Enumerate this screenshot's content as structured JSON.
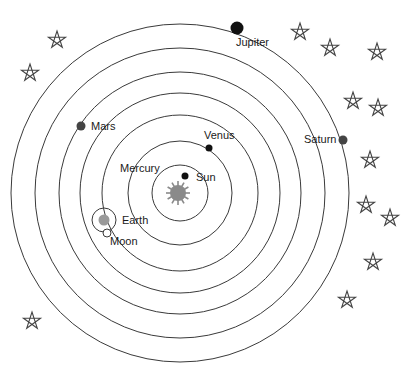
{
  "diagram": {
    "center": {
      "x": 180,
      "y": 193
    },
    "orbit_radii": [
      28,
      52,
      78,
      100,
      121,
      145,
      169
    ],
    "colors": {
      "orbit": "#3a3a3a",
      "sun": "#8a8a8a",
      "planet_dark": "#111111",
      "planet_gray": "#444444",
      "earth": "#9a9a9a",
      "star_stroke": "#444444",
      "background": "#ffffff"
    },
    "sun": {
      "label": "Sun",
      "x": 178,
      "y": 193,
      "r": 7,
      "ray_length": 12,
      "icon": "sun-icon"
    },
    "bodies": [
      {
        "name": "Mercury",
        "label": "Mercury",
        "x": 185,
        "y": 176,
        "r": 3.5,
        "label_x": 120,
        "label_y": 172
      },
      {
        "name": "Venus",
        "label": "Venus",
        "x": 209,
        "y": 148,
        "r": 3.5,
        "label_x": 204,
        "label_y": 139
      },
      {
        "name": "Earth",
        "label": "Earth",
        "x": 104,
        "y": 220,
        "r": 5.5,
        "label_x": 122,
        "label_y": 224
      },
      {
        "name": "Mars",
        "label": "Mars",
        "x": 81,
        "y": 126,
        "r": 4.5,
        "label_x": 91,
        "label_y": 130
      },
      {
        "name": "Jupiter",
        "label": "Jupiter",
        "x": 237,
        "y": 28,
        "r": 6.5,
        "label_x": 236,
        "label_y": 46
      },
      {
        "name": "Saturn",
        "label": "Saturn",
        "x": 343,
        "y": 140,
        "r": 4.5,
        "label_x": 304,
        "label_y": 143
      }
    ],
    "earth_epicycle": {
      "x": 104,
      "y": 220,
      "r": 12
    },
    "moon": {
      "label": "Moon",
      "x": 107,
      "y": 233,
      "r": 4,
      "label_x": 110,
      "label_y": 245
    },
    "stars": [
      {
        "x": 57,
        "y": 40
      },
      {
        "x": 30,
        "y": 73
      },
      {
        "x": 300,
        "y": 32
      },
      {
        "x": 330,
        "y": 48
      },
      {
        "x": 377,
        "y": 52
      },
      {
        "x": 353,
        "y": 101
      },
      {
        "x": 378,
        "y": 108
      },
      {
        "x": 370,
        "y": 160
      },
      {
        "x": 366,
        "y": 205
      },
      {
        "x": 390,
        "y": 218
      },
      {
        "x": 373,
        "y": 262
      },
      {
        "x": 347,
        "y": 300
      },
      {
        "x": 32,
        "y": 321
      }
    ],
    "star_size": 9
  }
}
